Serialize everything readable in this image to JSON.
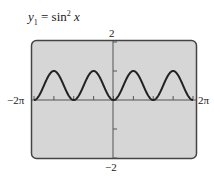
{
  "chart_data": {
    "type": "line",
    "title_parts": {
      "var": "y",
      "sub": "1",
      "eq": " = sin",
      "sup": "2",
      "arg": " x"
    },
    "function": "sin(x)^2",
    "xlim": [
      -6.2832,
      6.2832
    ],
    "ylim": [
      -2,
      2
    ],
    "x_tick_labels": {
      "left": "−2π",
      "right": "2π"
    },
    "y_tick_labels": {
      "top": "2",
      "bottom": "−2"
    },
    "x_ticks": [
      -6.2832,
      -4.7124,
      -3.1416,
      -1.5708,
      0,
      1.5708,
      3.1416,
      4.7124,
      6.2832
    ],
    "y_ticks": [
      -2,
      -1,
      0,
      1,
      2
    ],
    "series": [
      {
        "name": "y1",
        "x": [
          -6.2832,
          -5.4978,
          -4.7124,
          -3.927,
          -3.1416,
          -2.3562,
          -1.5708,
          -0.7854,
          0,
          0.7854,
          1.5708,
          2.3562,
          3.1416,
          3.927,
          4.7124,
          5.4978,
          6.2832
        ],
        "values": [
          0,
          0.5,
          1,
          0.5,
          0,
          0.5,
          1,
          0.5,
          0,
          0.5,
          1,
          0.5,
          0,
          0.5,
          1,
          0.5,
          0
        ]
      }
    ],
    "grid": false,
    "legend": "none"
  }
}
